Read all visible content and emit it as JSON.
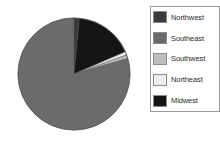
{
  "chart_data": {
    "type": "pie",
    "title": "",
    "subtitle": "",
    "xlabel": "",
    "ylabel": "",
    "grid": false,
    "legend_position": "right",
    "start_angle_deg": 0,
    "direction": "clockwise",
    "categories": [
      "Northwest",
      "Southeast",
      "Southwest",
      "Northeast",
      "Midwest"
    ],
    "values": [
      1.5,
      79.5,
      1.0,
      1.0,
      17.0
    ],
    "units": "percent",
    "colors": [
      "#3a3a3a",
      "#6b6b6b",
      "#bdbdbd",
      "#ececec",
      "#151515"
    ],
    "slices": [
      {
        "label": "Northwest",
        "value": 1.5,
        "color": "#3a3a3a",
        "start_deg": 0,
        "end_deg": 5.4
      },
      {
        "label": "Midwest",
        "value": 17.0,
        "color": "#151515",
        "start_deg": 5.4,
        "end_deg": 66.6
      },
      {
        "label": "Northeast",
        "value": 1.0,
        "color": "#ececec",
        "start_deg": 66.6,
        "end_deg": 70.2
      },
      {
        "label": "Southwest",
        "value": 1.0,
        "color": "#bdbdbd",
        "start_deg": 70.2,
        "end_deg": 73.8
      },
      {
        "label": "Southeast",
        "value": 79.5,
        "color": "#6b6b6b",
        "start_deg": 73.8,
        "end_deg": 360
      }
    ],
    "annotations": []
  },
  "legend": {
    "items": [
      {
        "label": "Northwest",
        "color": "#3a3a3a"
      },
      {
        "label": "Southeast",
        "color": "#6b6b6b"
      },
      {
        "label": "Southwest",
        "color": "#bdbdbd"
      },
      {
        "label": "Northeast",
        "color": "#ececec"
      },
      {
        "label": "Midwest",
        "color": "#151515"
      }
    ]
  },
  "style": {
    "background": "#ffffff",
    "pie_outline": "#5a5a5a",
    "legend_border": "#9a9a9a",
    "text_color": "#2b2b2b"
  },
  "geometry": {
    "center_x": 74,
    "center_y": 74,
    "radius": 56
  }
}
